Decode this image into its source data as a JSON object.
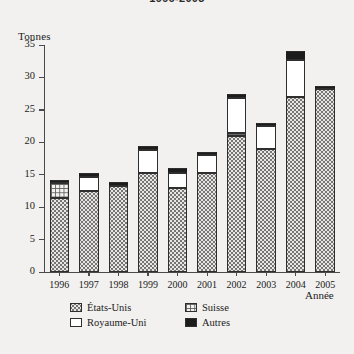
{
  "title": "1996-2005",
  "chart_data": {
    "type": "bar",
    "subtype": "stacked",
    "title": "1996-2005",
    "xlabel": "Année",
    "ylabel": "Tonnes",
    "ylim": [
      0,
      35
    ],
    "ytick_step": 5,
    "yticks": [
      0,
      5,
      10,
      15,
      20,
      25,
      30,
      35
    ],
    "grid": false,
    "legend_position": "bottom",
    "categories": [
      "1996",
      "1997",
      "1998",
      "1999",
      "2000",
      "2001",
      "2002",
      "2003",
      "2004",
      "2005"
    ],
    "series": [
      {
        "name": "États-Unis",
        "pattern": "dotted",
        "values": [
          11.4,
          12.5,
          13.2,
          15.2,
          13.0,
          15.3,
          21.0,
          19.0,
          27.0,
          28.2
        ]
      },
      {
        "name": "Suisse",
        "pattern": "grid",
        "values": [
          2.3,
          0,
          0,
          0,
          0,
          0,
          0.5,
          0,
          0,
          0
        ]
      },
      {
        "name": "Royaume-Uni",
        "pattern": "white",
        "values": [
          0,
          2.2,
          0,
          3.6,
          2.3,
          2.7,
          5.3,
          3.5,
          5.7,
          0
        ]
      },
      {
        "name": "Autres",
        "pattern": "black",
        "values": [
          0.5,
          0.6,
          0.6,
          0.6,
          0.7,
          0.5,
          0.7,
          0.5,
          1.3,
          0.5
        ]
      }
    ],
    "totals": [
      14.2,
      15.3,
      13.8,
      19.4,
      16.0,
      18.5,
      27.5,
      23.0,
      34.0,
      28.7
    ]
  },
  "axis": {
    "y_label": "Tonnes",
    "x_label": "Année",
    "y_ticks": [
      "0",
      "5",
      "10",
      "15",
      "20",
      "25",
      "30",
      "35"
    ],
    "x_ticks": [
      "1996",
      "1997",
      "1998",
      "1999",
      "2000",
      "2001",
      "2002",
      "2003",
      "2004",
      "2005"
    ]
  },
  "legend": {
    "items": [
      {
        "label": "États-Unis",
        "pattern": "dotted"
      },
      {
        "label": "Suisse",
        "pattern": "grid"
      },
      {
        "label": "Royaume-Uni",
        "pattern": "white"
      },
      {
        "label": "Autres",
        "pattern": "black"
      }
    ]
  },
  "colors": {
    "background": "#f2f1ef",
    "axis": "#4a4a4a",
    "outline": "#2e2e2e",
    "black_series": "#1c1c1c",
    "white_series": "#ffffff"
  }
}
